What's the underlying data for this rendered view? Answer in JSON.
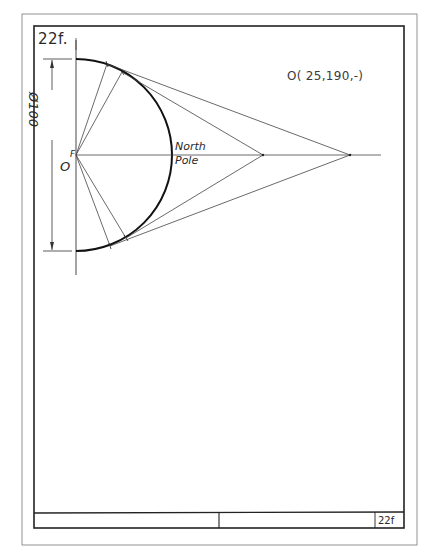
{
  "drawing": {
    "figure_id": "22f.",
    "origin_coordinates": "O( 25,190,-)",
    "diameter_dimension": "Ø100",
    "point_labels": {
      "origin": "O",
      "focus": "F",
      "north_pole_line1": "North",
      "north_pole_line2": "Pole"
    },
    "title_block": {
      "left_cell": "",
      "middle_cell": "",
      "sheet_number": "22f"
    },
    "colors": {
      "line": "#2a2a2a",
      "paper": "#ffffff"
    }
  }
}
